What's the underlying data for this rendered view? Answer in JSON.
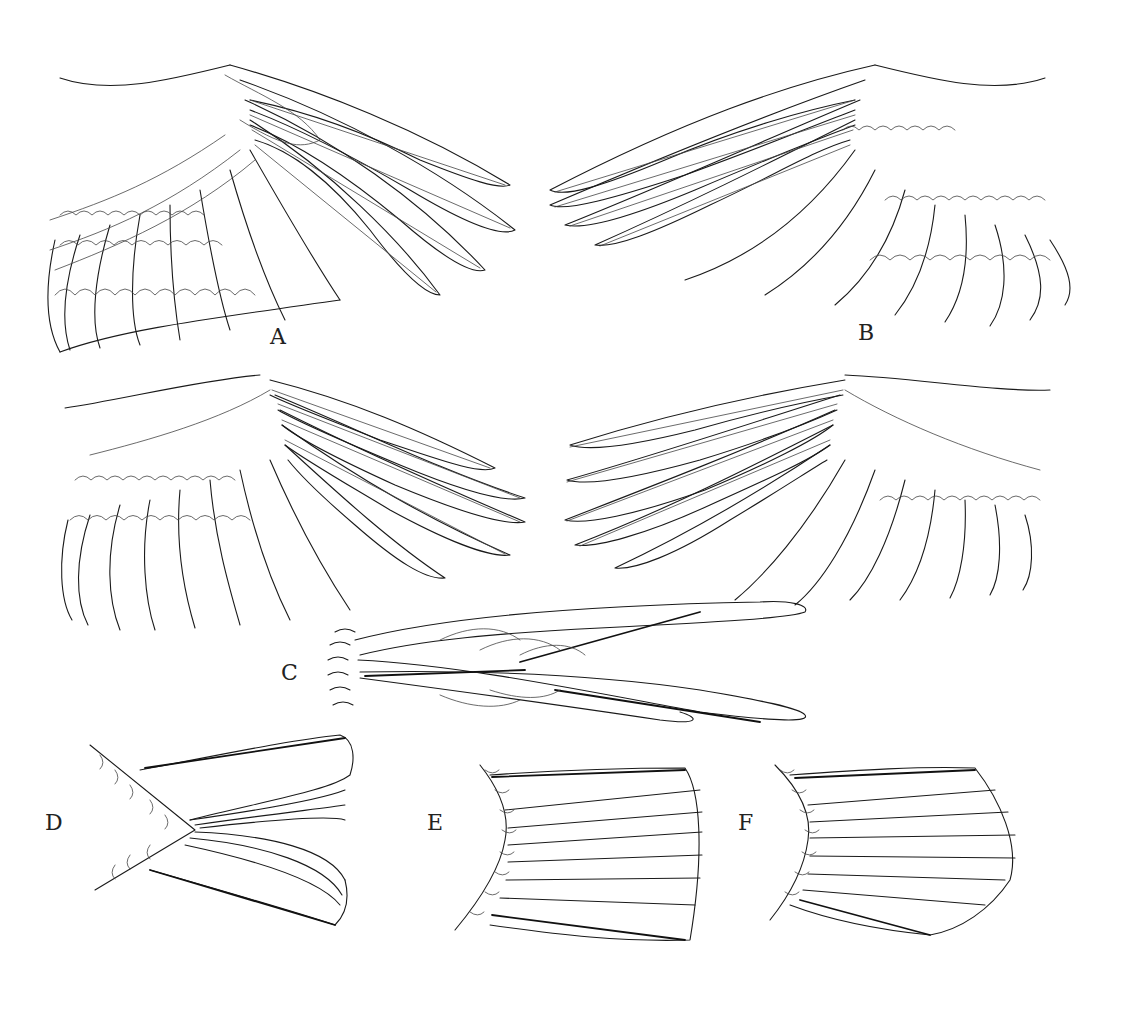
{
  "figure": {
    "background": "#ffffff",
    "line_color": "#1a1a1a",
    "panels": [
      {
        "id": "A",
        "label": "A",
        "description": "upper wing, spread, dorsal view (left)"
      },
      {
        "id": "B",
        "label": "B",
        "description": "upper wing, spread, dorsal view (right, mirrored)"
      },
      {
        "id": "wing-lower-left",
        "label": "",
        "description": "wing, lower row left"
      },
      {
        "id": "wing-lower-right",
        "label": "",
        "description": "wing, lower row right"
      },
      {
        "id": "C",
        "label": "C",
        "description": "closed tail, side view"
      },
      {
        "id": "D",
        "label": "D",
        "description": "forked tail"
      },
      {
        "id": "E",
        "label": "E",
        "description": "square tail"
      },
      {
        "id": "F",
        "label": "F",
        "description": "rounded tail"
      }
    ]
  }
}
